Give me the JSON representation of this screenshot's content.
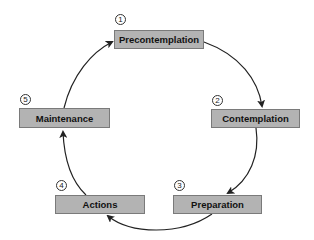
{
  "stages": [
    {
      "number": "1",
      "label": "Precontemplation"
    },
    {
      "number": "2",
      "label": "Contemplation"
    },
    {
      "number": "3",
      "label": "Preparation"
    },
    {
      "number": "4",
      "label": "Actions"
    },
    {
      "number": "5",
      "label": "Maintenance"
    }
  ],
  "colors": {
    "box_fill": "#b3b3b3",
    "box_border": "#7a7a7a",
    "arrow": "#222222"
  }
}
